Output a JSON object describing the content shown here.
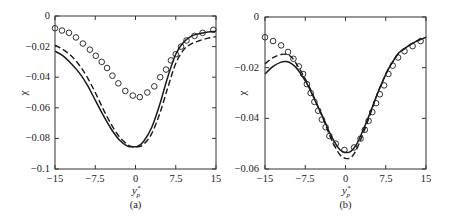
{
  "chart_data": [
    {
      "id": "a",
      "type": "line",
      "panel_label": "(a)",
      "title": "",
      "xlabel": "y*_p",
      "ylabel": "χ",
      "xlim": [
        -15,
        15
      ],
      "ylim": [
        -0.1,
        0
      ],
      "xticks": [
        -15,
        -7.5,
        0,
        7.5,
        15
      ],
      "xtick_labels": [
        "-15",
        "-7.5",
        "0",
        "7.5",
        "15"
      ],
      "yticks": [
        0,
        -0.02,
        -0.04,
        -0.06,
        -0.08,
        -0.1
      ],
      "ytick_labels": [
        "0",
        "-0.02",
        "-0.04",
        "-0.06",
        "-0.08",
        "-0.1"
      ],
      "grid": false,
      "legend": null,
      "series": [
        {
          "name": "solid",
          "style": "solid",
          "x": [
            -15,
            -13.5,
            -12,
            -10.5,
            -9,
            -7.5,
            -6,
            -4.5,
            -3,
            -1.5,
            -0.5,
            0.5,
            1.5,
            3,
            4.5,
            6,
            7.5,
            9,
            10.5,
            12,
            13.5,
            15
          ],
          "y": [
            -0.023,
            -0.026,
            -0.031,
            -0.037,
            -0.045,
            -0.055,
            -0.065,
            -0.074,
            -0.081,
            -0.085,
            -0.0855,
            -0.085,
            -0.082,
            -0.073,
            -0.058,
            -0.04,
            -0.025,
            -0.017,
            -0.013,
            -0.0115,
            -0.0105,
            -0.01
          ]
        },
        {
          "name": "dashed",
          "style": "dashed",
          "x": [
            -15,
            -13.5,
            -12,
            -10.5,
            -9,
            -7.5,
            -6,
            -4.5,
            -3,
            -1.5,
            -0.5,
            0.5,
            1.5,
            3,
            4.5,
            6,
            7.5,
            9,
            10.5,
            12,
            13.5,
            15
          ],
          "y": [
            -0.019,
            -0.022,
            -0.026,
            -0.032,
            -0.04,
            -0.05,
            -0.061,
            -0.071,
            -0.079,
            -0.084,
            -0.0855,
            -0.0855,
            -0.084,
            -0.077,
            -0.064,
            -0.047,
            -0.031,
            -0.022,
            -0.018,
            -0.016,
            -0.0145,
            -0.0135
          ]
        },
        {
          "name": "circles",
          "style": "markers",
          "marker": "open-circle",
          "x": [
            -15,
            -13.7,
            -12.4,
            -11.1,
            -9.8,
            -8.5,
            -7.4,
            -6.3,
            -5.3,
            -4.3,
            -3.2,
            -1.9,
            -0.5,
            0.8,
            2.2,
            3.5,
            4.6,
            5.7,
            6.6,
            7.5,
            8.5,
            9.5,
            11,
            12.5,
            14.5
          ],
          "y": [
            -0.008,
            -0.0095,
            -0.011,
            -0.014,
            -0.018,
            -0.022,
            -0.026,
            -0.03,
            -0.034,
            -0.039,
            -0.044,
            -0.049,
            -0.052,
            -0.053,
            -0.05,
            -0.046,
            -0.04,
            -0.035,
            -0.029,
            -0.025,
            -0.02,
            -0.016,
            -0.013,
            -0.011,
            -0.009
          ]
        }
      ]
    },
    {
      "id": "b",
      "type": "line",
      "panel_label": "(b)",
      "title": "",
      "xlabel": "y*_p",
      "ylabel": "χ",
      "xlim": [
        -15,
        15
      ],
      "ylim": [
        -0.06,
        0
      ],
      "xticks": [
        -15,
        -7.5,
        0,
        7.5,
        15
      ],
      "xtick_labels": [
        "-15",
        "-7.5",
        "0",
        "7.5",
        "15"
      ],
      "yticks": [
        0,
        -0.02,
        -0.04,
        -0.06
      ],
      "ytick_labels": [
        "0",
        "-0.02",
        "-0.04",
        "-0.06"
      ],
      "grid": false,
      "legend": null,
      "series": [
        {
          "name": "solid",
          "style": "solid",
          "x": [
            -15,
            -13.5,
            -12,
            -11,
            -10,
            -9,
            -8,
            -7,
            -6,
            -5,
            -4,
            -3,
            -2,
            -1,
            0,
            1,
            2,
            3,
            4,
            5,
            6,
            7,
            8,
            9,
            10,
            11,
            12,
            13,
            14,
            15
          ],
          "y": [
            -0.0225,
            -0.0195,
            -0.0178,
            -0.0176,
            -0.0185,
            -0.0205,
            -0.0235,
            -0.027,
            -0.0315,
            -0.036,
            -0.0405,
            -0.0455,
            -0.0495,
            -0.0525,
            -0.0535,
            -0.053,
            -0.0505,
            -0.046,
            -0.041,
            -0.0355,
            -0.03,
            -0.025,
            -0.0205,
            -0.017,
            -0.014,
            -0.0125,
            -0.011,
            -0.0098,
            -0.0088,
            -0.008
          ]
        },
        {
          "name": "dashed",
          "style": "dashed",
          "x": [
            -15,
            -13.5,
            -12,
            -11,
            -10,
            -9,
            -8,
            -7,
            -6,
            -5,
            -4,
            -3,
            -2,
            -1,
            0,
            1,
            2,
            3,
            4,
            5,
            6,
            7,
            8,
            9,
            10,
            11,
            12,
            13,
            14,
            15
          ],
          "y": [
            -0.0185,
            -0.016,
            -0.0148,
            -0.0148,
            -0.016,
            -0.019,
            -0.0225,
            -0.0265,
            -0.031,
            -0.036,
            -0.041,
            -0.0465,
            -0.051,
            -0.0545,
            -0.0558,
            -0.0555,
            -0.0525,
            -0.0475,
            -0.042,
            -0.036,
            -0.03,
            -0.025,
            -0.0205,
            -0.017,
            -0.014,
            -0.0125,
            -0.011,
            -0.0098,
            -0.0088,
            -0.008
          ]
        },
        {
          "name": "circles",
          "style": "markers",
          "marker": "open-circle",
          "x": [
            -15,
            -13.5,
            -12,
            -10.7,
            -9.7,
            -8.7,
            -7.9,
            -7.2,
            -6.5,
            -5.8,
            -5.1,
            -4.4,
            -3.7,
            -3,
            -1.8,
            -0.2,
            1.6,
            2.8,
            3.6,
            4.3,
            5,
            5.7,
            6.4,
            7.2,
            8,
            8.8,
            9.8,
            11,
            12.5,
            14
          ],
          "y": [
            -0.008,
            -0.0095,
            -0.0112,
            -0.0138,
            -0.0165,
            -0.0195,
            -0.0225,
            -0.0265,
            -0.03,
            -0.0335,
            -0.037,
            -0.0405,
            -0.0435,
            -0.047,
            -0.05,
            -0.0525,
            -0.0515,
            -0.048,
            -0.0445,
            -0.041,
            -0.0375,
            -0.034,
            -0.0305,
            -0.027,
            -0.0225,
            -0.0192,
            -0.016,
            -0.0135,
            -0.0115,
            -0.0095
          ]
        }
      ]
    }
  ],
  "panels": [
    {
      "label": "(a)",
      "ylabel": "χ",
      "xlabel_main": "y",
      "xlabel_sup": "*",
      "xlabel_sub": "p",
      "yticks": [
        "0",
        "−0.02",
        "−0.04",
        "−0.06",
        "−0.08",
        "−0.1"
      ],
      "xticks": [
        "−15",
        "−7.5",
        "0",
        "7.5",
        "15"
      ]
    },
    {
      "label": "(b)",
      "ylabel": "χ",
      "xlabel_main": "y",
      "xlabel_sup": "*",
      "xlabel_sub": "p",
      "yticks": [
        "0",
        "−0.02",
        "−0.04",
        "−0.06"
      ],
      "xticks": [
        "−15",
        "−7.5",
        "0",
        "7.5",
        "15"
      ]
    }
  ],
  "colors": {
    "line": "#1a1a1a",
    "axis": "#333333",
    "text": "#222222"
  }
}
